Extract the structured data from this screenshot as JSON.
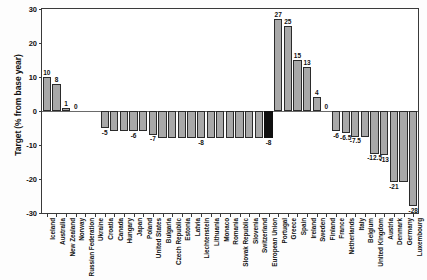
{
  "chart_data": {
    "type": "bar",
    "title": "",
    "xlabel": "",
    "ylabel": "Target (% from base year)",
    "ylim": [
      -30,
      30
    ],
    "yticks": [
      30,
      20,
      10,
      0,
      -10,
      -20,
      -30
    ],
    "ytick_labels": [
      "30",
      "20",
      "10",
      "0",
      "-10",
      "-20",
      "-30"
    ],
    "grid": false,
    "legend": "none",
    "highlight_color": "#101010",
    "bar_color": "#a8a8a8",
    "bar_edge_color": "#2b2b2b",
    "highlight_category": "European Union",
    "categories": [
      "Iceland",
      "Australia",
      "New Zealand",
      "Norway",
      "Russian Federation",
      "Ukraine",
      "Croatia",
      "Canada",
      "Hungary",
      "Japan",
      "Poland",
      "United States",
      "Bulgaria",
      "Czech Republic",
      "Estonia",
      "Latvia",
      "Liechtenstein",
      "Lithuania",
      "Monaco",
      "Romania",
      "Slovak Republic",
      "Slovenia",
      "Switzerland",
      "European Union",
      "Portugal",
      "Greece",
      "Spain",
      "Ireland",
      "Sweden",
      "Finland",
      "France",
      "Netherlands",
      "Italy",
      "Belgium",
      "United Kingdom",
      "Austria",
      "Denmark",
      "Germany",
      "Luxembourg"
    ],
    "values": [
      10,
      8,
      1,
      0,
      0,
      0,
      -5,
      -6,
      -6,
      -6,
      -6,
      -7,
      -8,
      -8,
      -8,
      -8,
      -8,
      -8,
      -8,
      -8,
      -8,
      -8,
      -8,
      -8,
      27,
      25,
      15,
      13,
      4,
      0,
      -6,
      -6.5,
      -7.5,
      -7.5,
      -12.5,
      -13,
      -21,
      -21,
      -28
    ],
    "point_labels": [
      "10",
      "8",
      "1",
      "0",
      "",
      "",
      "-5",
      "",
      "",
      "-6",
      "",
      "-7",
      "",
      "",
      "",
      "",
      "-8",
      "",
      "",
      "",
      "",
      "",
      "",
      "-8",
      "27",
      "25",
      "15",
      "13",
      "4",
      "0",
      "-6",
      "-6.5",
      "-7.5",
      "",
      "-12.5",
      "-13",
      "-21",
      "",
      "-28"
    ]
  }
}
